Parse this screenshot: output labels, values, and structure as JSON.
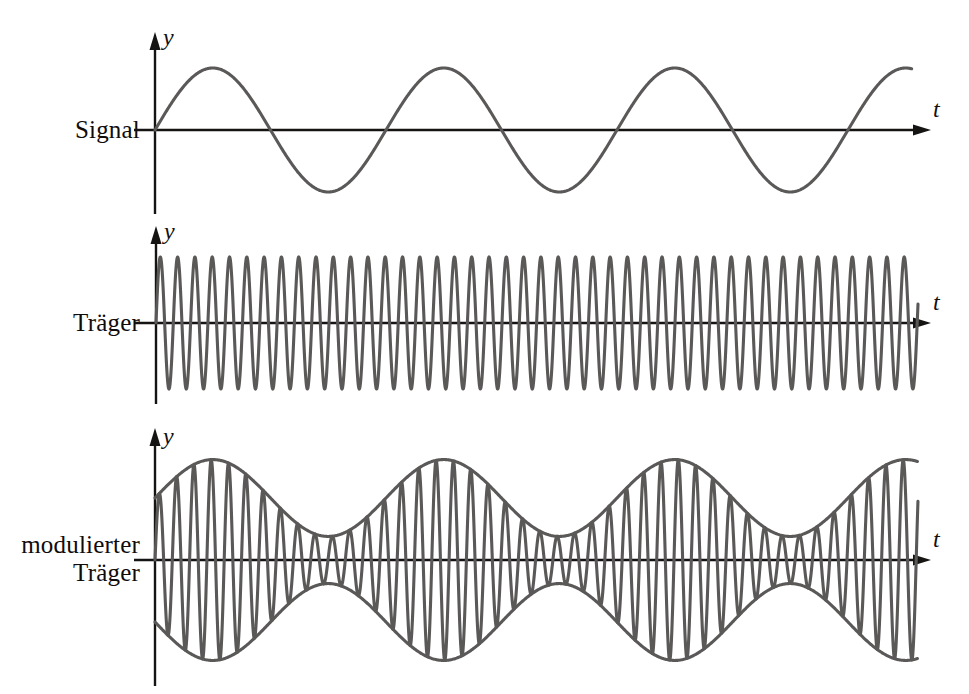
{
  "figure": {
    "background_color": "#ffffff",
    "curve_color": "#5b5858",
    "axis_color": "#161313",
    "text_color": "#100c0c",
    "language": "de"
  },
  "panels": [
    {
      "id": "signal",
      "label": "Signal",
      "label_lines": [
        "Signal"
      ],
      "y_axis_label": "y",
      "t_axis_label": "t",
      "origin": {
        "x": 155,
        "y": 130
      },
      "y_axis_top": 38,
      "y_axis_bottom": 214,
      "t_axis_end": 930,
      "wave": {
        "type": "sine",
        "amplitude": 62,
        "period_px": 231,
        "phase_deg": 0,
        "x_start": 155,
        "x_end": 912,
        "cycles_visible": 3.28
      }
    },
    {
      "id": "traeger",
      "label": "Träger",
      "label_lines": [
        "Träger"
      ],
      "y_axis_label": "y",
      "t_axis_label": "t",
      "origin": {
        "x": 156,
        "y": 323
      },
      "y_axis_top": 232,
      "y_axis_bottom": 404,
      "t_axis_end": 930,
      "wave": {
        "type": "sine",
        "amplitude": 66,
        "period_px": 17.3,
        "phase_deg": 0,
        "x_start": 156,
        "x_end": 918,
        "cycles_visible": 44
      }
    },
    {
      "id": "modulierter-traeger",
      "label": "modulierter Träger",
      "label_lines": [
        "modulierter",
        "Träger"
      ],
      "y_axis_label": "y",
      "t_axis_label": "t",
      "origin": {
        "x": 155,
        "y": 560
      },
      "y_axis_top": 434,
      "y_axis_bottom": 686,
      "t_axis_end": 930,
      "wave": {
        "type": "amplitude-modulated",
        "carrier_amplitude": 62,
        "carrier_period_px": 17.3,
        "modulation_index": 0.62,
        "modulation_period_px": 231,
        "modulation_phase_deg": 0,
        "x_start": 155,
        "x_end": 918,
        "envelope_visible": true
      }
    }
  ],
  "chart_data": {
    "type": "line",
    "xlabel": "t",
    "ylabel": "y",
    "grid": false,
    "legend": "none",
    "series": [
      {
        "name": "Signal",
        "description": "Niederfrequentes Nutzsignal",
        "formula": "y = A_s * sin(2*pi*t/T_s)",
        "amplitude": 1.0,
        "frequency_rel": 1,
        "period_px": 231,
        "cycles": 3.28
      },
      {
        "name": "Träger",
        "description": "Hochfrequente Trägerschwingung konstanter Amplitude",
        "formula": "y = A_c * sin(2*pi*t/T_c)",
        "amplitude": 1.0,
        "frequency_rel": 13.35,
        "period_px": 17.3,
        "cycles": 44
      },
      {
        "name": "modulierter Träger",
        "description": "Träger, dessen Amplitude dem Signal folgt (AM)",
        "formula": "y = A_c * (1 + m*sin(2*pi*t/T_s)) * sin(2*pi*t/T_c)",
        "modulation_index": 0.62,
        "carrier_period_px": 17.3,
        "envelope_period_px": 231,
        "cycles": 44
      }
    ]
  }
}
